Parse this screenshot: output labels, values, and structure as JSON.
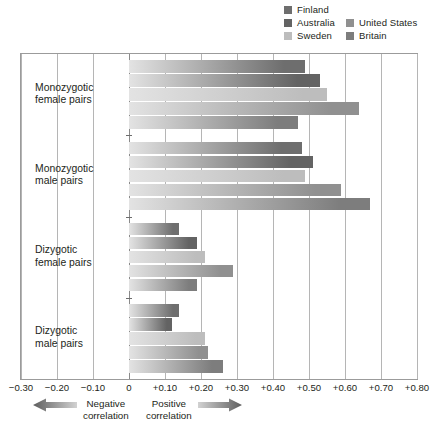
{
  "legend": {
    "columns": [
      [
        {
          "label": "Finland",
          "color": "#6e6e6e",
          "icon": "legend-swatch"
        },
        {
          "label": "Australia",
          "color": "#636363",
          "icon": "legend-swatch"
        },
        {
          "label": "Sweden",
          "color": "#bdbdbd",
          "icon": "legend-swatch"
        }
      ],
      [
        {
          "label": "United States",
          "color": "#909090",
          "icon": "legend-swatch"
        },
        {
          "label": "Britain",
          "color": "#7d7d7d",
          "icon": "legend-swatch"
        }
      ]
    ]
  },
  "footer": {
    "negative": "Negative\ncorrelation",
    "positive": "Positive\ncorrelation",
    "negative_arrow_icon": "arrow-left-icon",
    "positive_arrow_icon": "arrow-right-icon"
  },
  "chart_data": {
    "type": "bar",
    "orientation": "horizontal",
    "title": "",
    "xlabel": "",
    "ylabel": "",
    "xlim": [
      -0.3,
      0.8
    ],
    "xticks": [
      -0.3,
      -0.2,
      -0.1,
      0,
      0.1,
      0.2,
      0.3,
      0.4,
      0.5,
      0.6,
      0.7,
      0.8
    ],
    "xticklabels": [
      "−0.30",
      "−0.20",
      "−0.10",
      "0",
      "+0.10",
      "+0.20",
      "+0.30",
      "+0.40",
      "+0.50",
      "+0.60",
      "+0.70",
      "+0.80"
    ],
    "grid": true,
    "legend_position": "top-right",
    "categories": [
      "Monozygotic\nfemale pairs",
      "Monozygotic\nmale pairs",
      "Dizygotic\nfemale pairs",
      "Dizygotic\nmale pairs"
    ],
    "series": [
      {
        "name": "Finland",
        "color": "#6e6e6e",
        "values": [
          0.49,
          0.48,
          0.14,
          0.14
        ]
      },
      {
        "name": "Australia",
        "color": "#636363",
        "values": [
          0.53,
          0.51,
          0.19,
          0.12
        ]
      },
      {
        "name": "Sweden",
        "color": "#bdbdbd",
        "values": [
          0.55,
          0.49,
          0.21,
          0.21
        ]
      },
      {
        "name": "United States",
        "color": "#909090",
        "values": [
          0.64,
          0.59,
          0.29,
          0.22
        ]
      },
      {
        "name": "Britain",
        "color": "#7d7d7d",
        "values": [
          0.47,
          0.67,
          0.19,
          0.26
        ]
      }
    ]
  }
}
